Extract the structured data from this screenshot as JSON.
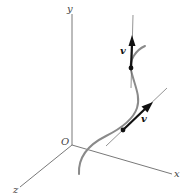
{
  "diagram": {
    "axes": {
      "y_label": "y",
      "x_label": "x",
      "z_label": "z",
      "origin_label": "O"
    },
    "vectors": [
      {
        "label": "v",
        "position": "upper"
      },
      {
        "label": "v",
        "position": "lower"
      }
    ],
    "colors": {
      "axis": "#555555",
      "curve": "#8a8a8a",
      "vector": "#111111",
      "tangent_line": "#666666"
    }
  }
}
